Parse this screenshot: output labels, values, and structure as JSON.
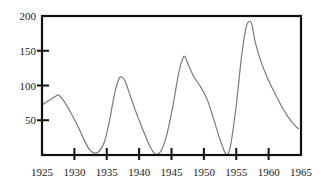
{
  "chart_data": {
    "type": "line",
    "title": "",
    "xlabel": "",
    "ylabel": "",
    "xlim": [
      1925,
      1965
    ],
    "ylim": [
      0,
      200
    ],
    "grid": false,
    "legend": null,
    "x_ticks": [
      1925,
      1930,
      1935,
      1940,
      1945,
      1950,
      1955,
      1960,
      1965
    ],
    "x_tick_labels": [
      "1925",
      "1930",
      "1935",
      "1940",
      "1945",
      "1950",
      "1955",
      "1960",
      "1965"
    ],
    "y_ticks": [
      50,
      100,
      150,
      200
    ],
    "y_tick_labels": [
      "50",
      "100",
      "150",
      "200"
    ],
    "series": [
      {
        "name": "series",
        "color": "#7a7a7a",
        "points": [
          [
            1925.0,
            72
          ],
          [
            1926.0,
            78
          ],
          [
            1927.0,
            84
          ],
          [
            1927.6,
            86
          ],
          [
            1928.5,
            76
          ],
          [
            1929.5,
            60
          ],
          [
            1930.5,
            42
          ],
          [
            1931.5,
            22
          ],
          [
            1932.3,
            8
          ],
          [
            1933.0,
            3
          ],
          [
            1933.8,
            5
          ],
          [
            1934.6,
            18
          ],
          [
            1935.4,
            48
          ],
          [
            1936.2,
            88
          ],
          [
            1936.9,
            110
          ],
          [
            1937.3,
            112
          ],
          [
            1937.8,
            107
          ],
          [
            1938.6,
            86
          ],
          [
            1939.5,
            62
          ],
          [
            1940.5,
            38
          ],
          [
            1941.5,
            16
          ],
          [
            1942.3,
            3
          ],
          [
            1942.8,
            1
          ],
          [
            1943.5,
            8
          ],
          [
            1944.3,
            30
          ],
          [
            1945.2,
            70
          ],
          [
            1946.2,
            122
          ],
          [
            1946.8,
            140
          ],
          [
            1947.1,
            141
          ],
          [
            1947.6,
            130
          ],
          [
            1948.5,
            112
          ],
          [
            1949.5,
            98
          ],
          [
            1950.5,
            80
          ],
          [
            1951.5,
            52
          ],
          [
            1952.5,
            22
          ],
          [
            1953.3,
            3
          ],
          [
            1953.7,
            1
          ],
          [
            1954.2,
            18
          ],
          [
            1955.0,
            72
          ],
          [
            1955.8,
            140
          ],
          [
            1956.5,
            183
          ],
          [
            1957.0,
            192
          ],
          [
            1957.4,
            188
          ],
          [
            1958.0,
            160
          ],
          [
            1959.0,
            130
          ],
          [
            1960.0,
            107
          ],
          [
            1961.0,
            88
          ],
          [
            1962.0,
            70
          ],
          [
            1963.0,
            55
          ],
          [
            1964.0,
            43
          ],
          [
            1964.6,
            38
          ]
        ]
      }
    ]
  }
}
